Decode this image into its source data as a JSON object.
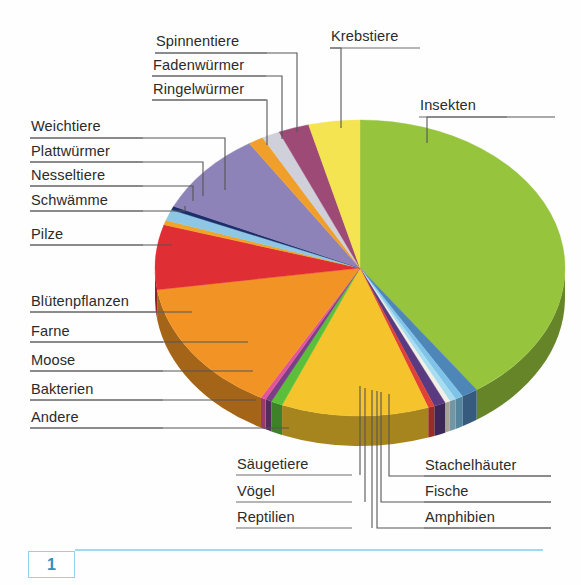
{
  "figure": {
    "number": "1",
    "caption_rule": true
  },
  "chart_data": {
    "type": "pie",
    "title": "",
    "subtitle": "",
    "xlabel": "",
    "ylabel": "",
    "legend_position": "callout-labels",
    "grid": false,
    "style": "3d-exploded-none",
    "note": "Anteile der Artenzahlen bekannter Lebewesen-Gruppen; Werte als Prozentanteile des Vollkreises geschätzt.",
    "start_angle_deg": -90,
    "direction": "clockwise",
    "categories": [
      "Insekten",
      "Stachelhäuter",
      "Fische",
      "Amphibien",
      "Reptilien",
      "Vögel",
      "Säugetiere",
      "Andere",
      "Bakterien",
      "Moose",
      "Farne",
      "Blütenpflanzen",
      "Pilze",
      "Schwämme",
      "Nesseltiere",
      "Plattwürmer",
      "Weichtiere",
      "Ringelwürmer",
      "Fadenwürmer",
      "Spinnentiere",
      "Krebstiere"
    ],
    "values": [
      40.0,
      1.3,
      0.6,
      0.5,
      0.4,
      0.9,
      0.5,
      11.5,
      0.9,
      0.5,
      0.4,
      14.5,
      7.0,
      0.5,
      1.2,
      0.4,
      9.0,
      1.2,
      1.4,
      2.4,
      4.0
    ],
    "colors": [
      "#96c43c",
      "#4f86b8",
      "#7fc4e8",
      "#a8dcef",
      "#f2f0e4",
      "#5a3a80",
      "#e04236",
      "#f5c32c",
      "#5bbf3a",
      "#7a3f87",
      "#e2559a",
      "#f29425",
      "#e02e35",
      "#f0a428",
      "#8ec7e6",
      "#1c2d6b",
      "#8d83b8",
      "#f0a02a",
      "#cfd0da",
      "#9e4a77",
      "#f4e452"
    ],
    "units": "percent"
  },
  "labels": {
    "left_upper": [
      {
        "text": "Weichtiere"
      },
      {
        "text": "Plattwürmer"
      },
      {
        "text": "Nesseltiere"
      },
      {
        "text": "Schwämme"
      },
      {
        "text": "Pilze"
      }
    ],
    "left_lower": [
      {
        "text": "Blütenpflanzen"
      },
      {
        "text": "Farne"
      },
      {
        "text": "Moose"
      },
      {
        "text": "Bakterien"
      },
      {
        "text": "Andere"
      }
    ],
    "top_left_stack": [
      {
        "text": "Spinnentiere"
      },
      {
        "text": "Fadenwürmer"
      },
      {
        "text": "Ringelwürmer"
      }
    ],
    "top_right": [
      {
        "text": "Krebstiere"
      },
      {
        "text": "Insekten"
      }
    ],
    "bottom_left_stack": [
      {
        "text": "Säugetiere"
      },
      {
        "text": "Vögel"
      },
      {
        "text": "Reptilien"
      }
    ],
    "bottom_right_stack": [
      {
        "text": "Stachelhäuter"
      },
      {
        "text": "Fische"
      },
      {
        "text": "Amphibien"
      }
    ]
  },
  "colors": {
    "leader_line": "#555555",
    "label_text": "#2b2b2b",
    "figure_box_border": "#8fd3ea",
    "figure_box_text": "#2f8fc0",
    "figure_rule": "#9fdaee",
    "background": "#ffffff"
  }
}
